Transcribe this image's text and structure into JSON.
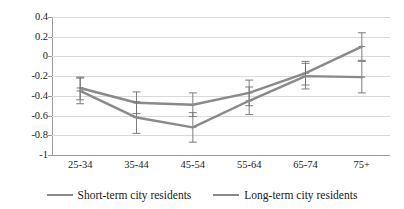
{
  "chart_data": {
    "type": "line",
    "title": "",
    "subtitle": "",
    "xlabel": "",
    "ylabel": "",
    "categories": [
      "25-34",
      "35-44",
      "45-54",
      "55-64",
      "65-74",
      "75+"
    ],
    "ylim": [
      -1,
      0.4
    ],
    "yticks": [
      0.4,
      0.2,
      0,
      -0.2,
      -0.4,
      -0.6,
      -0.8,
      -1
    ],
    "ytick_labels": [
      "0.4",
      "0.2",
      "0",
      "-0.2",
      "-0.4",
      "-0.6",
      "-0.8",
      "-1"
    ],
    "grid": true,
    "grid_axis": "y",
    "legend_position": "bottom",
    "series": [
      {
        "name": "Short-term city residents",
        "color": "#8a8a8a",
        "values": [
          -0.32,
          -0.47,
          -0.49,
          -0.37,
          -0.17,
          0.1
        ],
        "error_low": [
          -0.44,
          -0.58,
          -0.61,
          -0.5,
          -0.29,
          -0.04
        ],
        "error_high": [
          -0.21,
          -0.36,
          -0.37,
          -0.24,
          -0.05,
          0.24
        ]
      },
      {
        "name": "Long-term city residents",
        "color": "#8a8a8a",
        "values": [
          -0.35,
          -0.62,
          -0.72,
          -0.45,
          -0.2,
          -0.21
        ],
        "error_low": [
          -0.48,
          -0.78,
          -0.87,
          -0.59,
          -0.33,
          -0.37
        ],
        "error_high": [
          -0.22,
          -0.46,
          -0.57,
          -0.31,
          -0.07,
          -0.05
        ]
      }
    ]
  },
  "legend": {
    "items": [
      {
        "label": "Short-term city residents"
      },
      {
        "label": "Long-term city residents"
      }
    ]
  }
}
